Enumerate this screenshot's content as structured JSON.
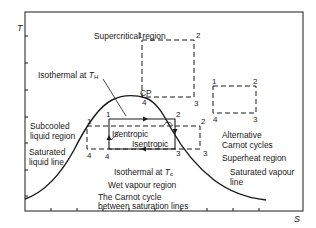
{
  "axes": {
    "y_label": "T",
    "x_label": "S"
  },
  "labels": {
    "supercritical": "Supercritical region",
    "isothermal_h_prefix": "Isothermal at ",
    "isothermal_h_var": "T",
    "isothermal_h_sub": "H",
    "cp": "CP",
    "subcooled_1": "Subcooled",
    "subcooled_2": "liquid region",
    "sat_liquid_1": "Saturated",
    "sat_liquid_2": "liquid line",
    "isentropic_left": "Isentropic",
    "isentropic_right": "Isentropic",
    "isothermal_c_prefix": "Isothermal at ",
    "isothermal_c_var": "T",
    "isothermal_c_sub": "c",
    "wet_vapour": "Wet vapour region",
    "carnot_1": "The Carnot cycle",
    "carnot_2": "between saturation lines",
    "alt_carnot_1": "Alternative",
    "alt_carnot_2": "Carnot cycles",
    "superheat": "Superheat region",
    "sat_vapour_1": "Saturated vapour",
    "sat_vapour_2": "line"
  },
  "cycles": {
    "main": {
      "p1": "1",
      "p2": "2",
      "p3": "3",
      "p4": "4"
    },
    "top": {
      "p1": "1",
      "p2": "2",
      "p3": "3",
      "p4": "4"
    },
    "wide": {
      "p1": "1",
      "p2": "2",
      "p3": "3",
      "p4": "4"
    },
    "right": {
      "p1": "1",
      "p2": "2",
      "p3": "3",
      "p4": "4"
    }
  },
  "colors": {
    "line": "#1a1a1a",
    "background": "#ffffff"
  }
}
